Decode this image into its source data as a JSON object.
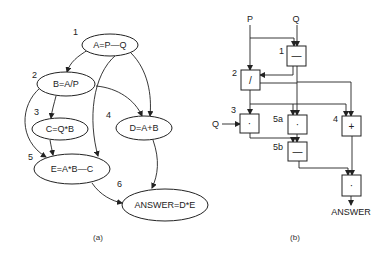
{
  "figure": {
    "panel_a": {
      "caption": "(a)",
      "nodes": [
        {
          "id": "1",
          "step": "1",
          "label": "A=P—Q"
        },
        {
          "id": "2",
          "step": "2",
          "label": "B=A/P"
        },
        {
          "id": "3",
          "step": "3",
          "label": "C=Q*B"
        },
        {
          "id": "4",
          "step": "4",
          "label": "D=A+B"
        },
        {
          "id": "5",
          "step": "5",
          "label": "E=A*B—C"
        },
        {
          "id": "6",
          "step": "6",
          "label": "ANSWER=D*E"
        }
      ],
      "edges": [
        {
          "from": "1",
          "to": "2"
        },
        {
          "from": "1",
          "to": "4"
        },
        {
          "from": "1",
          "to": "5"
        },
        {
          "from": "2",
          "to": "3"
        },
        {
          "from": "2",
          "to": "4"
        },
        {
          "from": "2",
          "to": "5"
        },
        {
          "from": "3",
          "to": "5"
        },
        {
          "from": "4",
          "to": "6"
        },
        {
          "from": "5",
          "to": "6"
        }
      ]
    },
    "panel_b": {
      "caption": "(b)",
      "inputs": {
        "p": "P",
        "q": "Q",
        "q2": "Q"
      },
      "output": "ANSWER",
      "boxes": [
        {
          "id": "1",
          "step": "1",
          "op": "—"
        },
        {
          "id": "2",
          "step": "2",
          "op": "/"
        },
        {
          "id": "3",
          "step": "3",
          "op": "·"
        },
        {
          "id": "5a",
          "step": "5a",
          "op": "·"
        },
        {
          "id": "4",
          "step": "4",
          "op": "+"
        },
        {
          "id": "5b",
          "step": "5b",
          "op": "—"
        },
        {
          "id": "6",
          "step": "",
          "op": "·"
        }
      ]
    }
  }
}
